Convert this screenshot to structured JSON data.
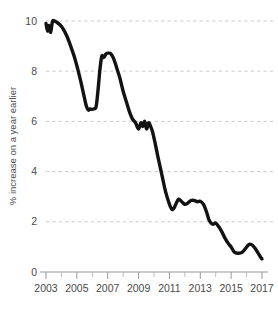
{
  "chart_data": {
    "type": "line",
    "title": "",
    "subtitle": "",
    "xlabel": "",
    "ylabel": "% increase on a year earlier",
    "xlim": [
      2003,
      2017
    ],
    "ylim": [
      0,
      10
    ],
    "grid": true,
    "legend": null,
    "legend_position": "none",
    "y_ticks": [
      0,
      2,
      4,
      6,
      8,
      10
    ],
    "y_tick_labels": [
      "0",
      "2",
      "4",
      "6",
      "8",
      "10"
    ],
    "x_ticks": [
      2003,
      2005,
      2007,
      2009,
      2011,
      2013,
      2015,
      2017
    ],
    "x_tick_labels": [
      "2003",
      "2005",
      "2007",
      "2009",
      "2011",
      "2013",
      "2015",
      "2017"
    ],
    "x_minor_ticks": [
      2004,
      2006,
      2008,
      2010,
      2012,
      2014,
      2016
    ],
    "line_color": "#121212",
    "grid_color": "#bdbdbd",
    "axis_color": "#9a9a9a",
    "series": [
      {
        "name": "% increase on a year earlier",
        "color": "#121212",
        "x": [
          2003.0,
          2003.1,
          2003.2,
          2003.3,
          2003.42,
          2003.55,
          2003.7,
          2003.9,
          2004.1,
          2004.35,
          2004.6,
          2004.85,
          2005.05,
          2005.25,
          2005.45,
          2005.62,
          2005.75,
          2005.85,
          2005.95,
          2006.1,
          2006.25,
          2006.38,
          2006.5,
          2006.62,
          2006.75,
          2006.9,
          2007.05,
          2007.2,
          2007.35,
          2007.5,
          2007.65,
          2007.8,
          2008.0,
          2008.2,
          2008.4,
          2008.6,
          2008.8,
          2009.0,
          2009.15,
          2009.28,
          2009.4,
          2009.52,
          2009.65,
          2009.78,
          2009.9,
          2010.05,
          2010.25,
          2010.5,
          2010.75,
          2011.0,
          2011.15,
          2011.3,
          2011.45,
          2011.6,
          2011.8,
          2012.0,
          2012.2,
          2012.4,
          2012.6,
          2012.8,
          2013.0,
          2013.2,
          2013.4,
          2013.55,
          2013.7,
          2013.85,
          2014.0,
          2014.2,
          2014.4,
          2014.6,
          2014.8,
          2015.0,
          2015.2,
          2015.45,
          2015.7,
          2015.95,
          2016.15,
          2016.35,
          2016.55,
          2016.75,
          2016.9,
          2017.0
        ],
        "y": [
          9.9,
          9.6,
          9.82,
          9.55,
          9.98,
          10.0,
          9.95,
          9.85,
          9.7,
          9.4,
          9.0,
          8.55,
          8.1,
          7.6,
          7.05,
          6.6,
          6.45,
          6.5,
          6.48,
          6.5,
          6.6,
          7.3,
          8.1,
          8.6,
          8.55,
          8.7,
          8.72,
          8.7,
          8.55,
          8.3,
          8.0,
          7.7,
          7.2,
          6.8,
          6.4,
          6.1,
          5.95,
          5.7,
          5.95,
          5.8,
          6.0,
          5.7,
          5.95,
          5.8,
          5.6,
          5.2,
          4.6,
          3.9,
          3.2,
          2.7,
          2.5,
          2.55,
          2.75,
          2.9,
          2.8,
          2.7,
          2.75,
          2.85,
          2.85,
          2.8,
          2.82,
          2.7,
          2.4,
          2.1,
          1.95,
          1.9,
          1.95,
          1.8,
          1.6,
          1.35,
          1.15,
          1.0,
          0.8,
          0.75,
          0.78,
          0.95,
          1.1,
          1.08,
          0.95,
          0.75,
          0.6,
          0.52
        ]
      }
    ],
    "annotations": []
  }
}
